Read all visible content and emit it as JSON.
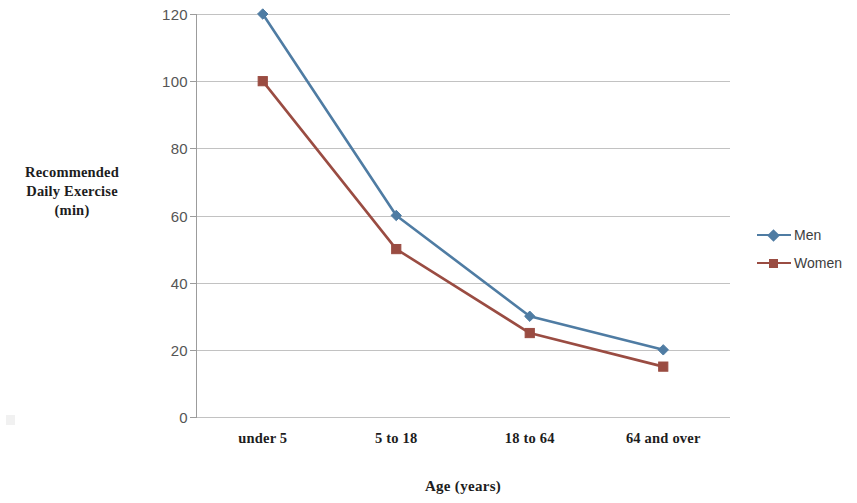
{
  "chart_data": {
    "type": "line",
    "title": "",
    "xlabel": "Age (years)",
    "ylabel": "Recommended Daily Exercise (min)",
    "ylabel_lines": [
      "Recommended",
      "Daily Exercise",
      "(min)"
    ],
    "categories": [
      "under 5",
      "5 to 18",
      "18 to 64",
      "64 and over"
    ],
    "series": [
      {
        "name": "Men",
        "values": [
          120,
          60,
          30,
          20
        ],
        "color": "#4F7CA3",
        "marker": "diamond"
      },
      {
        "name": "Women",
        "values": [
          100,
          50,
          25,
          15
        ],
        "color": "#9A4C42",
        "marker": "square"
      }
    ],
    "ylim": [
      0,
      120
    ],
    "yticks": [
      0,
      20,
      40,
      60,
      80,
      100,
      120
    ],
    "ytick_labels": [
      "0",
      "20",
      "40",
      "60",
      "80",
      "100",
      "120"
    ],
    "grid": "horizontal",
    "legend_position": "right",
    "legend_entries": [
      "Men",
      "Women"
    ],
    "gridline_color": "#C2C2C2",
    "axis_color": "#9C9C9C",
    "background": "#FFFFFF"
  }
}
